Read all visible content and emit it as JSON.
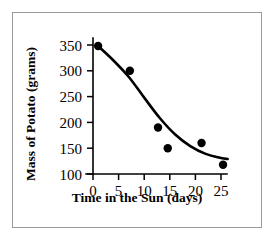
{
  "chart_data": {
    "type": "scatter",
    "title": "",
    "xlabel": "Time in the Sun (days)",
    "ylabel": "Mass of Potato (grams)",
    "xlim": [
      0,
      26
    ],
    "ylim": [
      100,
      360
    ],
    "xticks": [
      0,
      5,
      10,
      15,
      20,
      25
    ],
    "yticks": [
      100,
      150,
      200,
      250,
      300,
      350
    ],
    "xtick_labels": [
      "0",
      "5",
      "10",
      "15",
      "20",
      "25"
    ],
    "ytick_labels": [
      "100",
      "150",
      "200",
      "250",
      "300",
      "350"
    ],
    "grid": false,
    "legend": false,
    "series": [
      {
        "name": "Potato mass measurements",
        "type": "scatter",
        "marker": "filled-circle",
        "color": "#000000",
        "points": [
          {
            "x": 1.0,
            "y": 348
          },
          {
            "x": 7.2,
            "y": 300
          },
          {
            "x": 12.7,
            "y": 190
          },
          {
            "x": 14.6,
            "y": 150
          },
          {
            "x": 21.2,
            "y": 160
          },
          {
            "x": 25.4,
            "y": 118
          }
        ]
      },
      {
        "name": "Best fit decay curve",
        "type": "line",
        "color": "#000000",
        "points": [
          {
            "x": 1.0,
            "y": 348
          },
          {
            "x": 4.0,
            "y": 320
          },
          {
            "x": 7.0,
            "y": 288
          },
          {
            "x": 10.0,
            "y": 248
          },
          {
            "x": 13.0,
            "y": 209
          },
          {
            "x": 16.0,
            "y": 177
          },
          {
            "x": 19.0,
            "y": 154
          },
          {
            "x": 22.0,
            "y": 139
          },
          {
            "x": 25.0,
            "y": 131
          },
          {
            "x": 26.3,
            "y": 129
          }
        ]
      }
    ]
  },
  "axes": {
    "y_axis_title": "Mass of Potato (grams)",
    "x_axis_title": "Time in the Sun (days)"
  }
}
